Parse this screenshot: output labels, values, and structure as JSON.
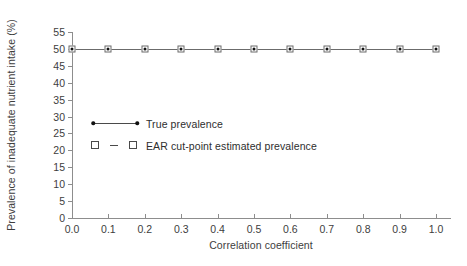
{
  "chart_data": {
    "type": "line",
    "title": "",
    "xlabel": "Correlation coefficient",
    "ylabel": "Prevalence of inadequate nutrient intake (%)",
    "x": [
      0.0,
      0.1,
      0.2,
      0.3,
      0.4,
      0.5,
      0.6,
      0.7,
      0.8,
      0.9,
      1.0
    ],
    "xlim": [
      0.0,
      1.0
    ],
    "ylim": [
      0,
      55
    ],
    "xticks": [
      "0.0",
      "0.1",
      "0.2",
      "0.3",
      "0.4",
      "0.5",
      "0.6",
      "0.7",
      "0.8",
      "0.9",
      "1.0"
    ],
    "yticks": [
      "0",
      "5",
      "10",
      "15",
      "20",
      "25",
      "30",
      "35",
      "40",
      "45",
      "50",
      "55"
    ],
    "ytick_values": [
      0,
      5,
      10,
      15,
      20,
      25,
      30,
      35,
      40,
      45,
      50,
      55
    ],
    "grid": false,
    "legend_position": "inside-left",
    "series": [
      {
        "name": "True prevalence",
        "marker": "filled-circle",
        "linestyle": "solid",
        "color": "#6e6e6e",
        "values": [
          50,
          50,
          50,
          50,
          50,
          50,
          50,
          50,
          50,
          50,
          50
        ]
      },
      {
        "name": "EAR cut-point estimated prevalence",
        "marker": "open-square",
        "linestyle": "dashed",
        "color": "#6b6b6b",
        "values": [
          50,
          50,
          50,
          50,
          50,
          50,
          50,
          50,
          50,
          50,
          50
        ]
      }
    ]
  },
  "legend": {
    "items": [
      {
        "label": "True prevalence"
      },
      {
        "label": "EAR cut-point estimated prevalence"
      }
    ]
  }
}
